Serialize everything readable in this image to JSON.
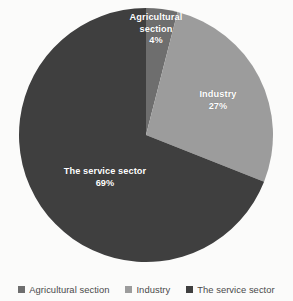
{
  "chart_data": {
    "type": "pie",
    "title": "",
    "categories": [
      "Agricultural section",
      "Industry",
      "The service sector"
    ],
    "values": [
      4,
      27,
      69
    ],
    "value_labels": [
      "4%",
      "27%",
      "69%"
    ],
    "unit": "%",
    "start_angle_deg": 0,
    "direction": "clockwise",
    "legend_position": "bottom",
    "grid": false,
    "colors": [
      "#6E6E6E",
      "#9C9C9C",
      "#3F3F3F"
    ],
    "slices": [
      {
        "label": "Agricultural section",
        "label_line1": "Agricultural",
        "label_line2": "section",
        "value": 4,
        "value_label": "4%",
        "color": "#6E6E6E"
      },
      {
        "label": "Industry",
        "label_line1": "Industry",
        "label_line2": "",
        "value": 27,
        "value_label": "27%",
        "color": "#9C9C9C"
      },
      {
        "label": "The service sector",
        "label_line1": "The service sector",
        "label_line2": "",
        "value": 69,
        "value_label": "69%",
        "color": "#3F3F3F"
      }
    ]
  },
  "legend": {
    "items": [
      {
        "label": "Agricultural section",
        "color": "#6E6E6E"
      },
      {
        "label": "Industry",
        "color": "#9C9C9C"
      },
      {
        "label": "The service sector",
        "color": "#3F3F3F"
      }
    ]
  },
  "geometry": {
    "center_x": 146,
    "center_y": 135,
    "radius": 127
  }
}
